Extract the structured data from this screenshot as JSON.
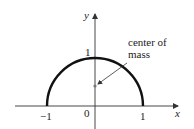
{
  "diagram": {
    "title": "",
    "axes": {
      "x_label": "x",
      "y_label": "y",
      "x_ticks": [
        "−1",
        "0",
        "1"
      ],
      "y_ticks": [
        "1"
      ]
    },
    "curve": {
      "type": "semicircle",
      "description": "upper half of unit circle",
      "radius": 1,
      "color": "#111111"
    },
    "annotation": {
      "text_line1": "center of",
      "text_line2": "mass",
      "point": [
        0,
        0.42
      ]
    },
    "colors": {
      "axis": "#333333",
      "curve": "#111111",
      "text": "#222222",
      "point": "#777777"
    }
  }
}
